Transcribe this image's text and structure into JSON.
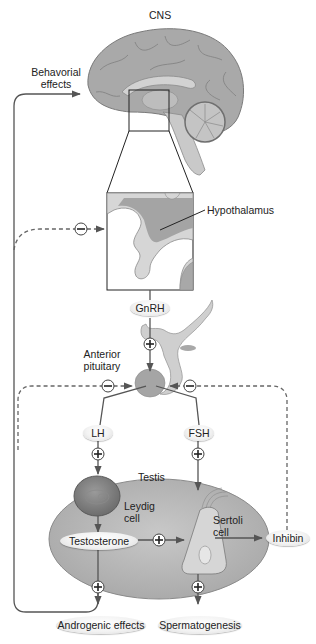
{
  "labels": {
    "cns": "CNS",
    "behavioral_effects_line1": "Behavorial",
    "behavioral_effects_line2": "effects",
    "hypothalamus": "Hypothalamus",
    "gnrh": "GnRH",
    "anterior_pituitary_line1": "Anterior",
    "anterior_pituitary_line2": "pituitary",
    "lh": "LH",
    "fsh": "FSH",
    "testis": "Testis",
    "leydig_line1": "Leydig",
    "leydig_line2": "cell",
    "sertoli_line1": "Sertoli",
    "sertoli_line2": "cell",
    "testosterone": "Testosterone",
    "inhibin": "Inhibin",
    "androgenic_effects": "Androgenic effects",
    "spermatogenesis": "Spermatogenesis"
  },
  "signs": {
    "plus": "+",
    "minus": "−"
  },
  "colors": {
    "brain": "#a8a8a8",
    "brain_light": "#cfcfcf",
    "testis": "#b8b8b8",
    "arrow": "#555555",
    "dashed_feedback": "#666666"
  }
}
